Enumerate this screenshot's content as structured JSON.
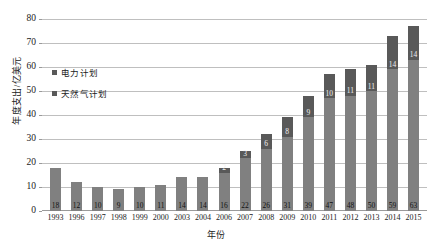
{
  "chart_data": {
    "type": "bar",
    "subtype": "stacked-bar",
    "title": "",
    "xlabel": "年份",
    "ylabel": "年度支出/亿美元",
    "ylim": [
      0,
      80
    ],
    "ytick_step": 10,
    "yticks": [
      "0",
      "10",
      "20",
      "30",
      "40",
      "50",
      "60",
      "70",
      "80"
    ],
    "grid": true,
    "legend_position": "inside-upper-left",
    "categories": [
      "1993",
      "1996",
      "1997",
      "1998",
      "1999",
      "2000",
      "2003",
      "2004",
      "2006",
      "2007",
      "2008",
      "2009",
      "2010",
      "2011",
      "2012",
      "2013",
      "2014",
      "2015"
    ],
    "series": [
      {
        "name": "天然气计划",
        "color": "#808080",
        "values": [
          18,
          12,
          10,
          9,
          10,
          11,
          14,
          14,
          16,
          22,
          26,
          31,
          39,
          47,
          48,
          50,
          59,
          63
        ],
        "labels": [
          "18",
          "12",
          "10",
          "9",
          "10",
          "11",
          "14",
          "14",
          "16",
          "22",
          "26",
          "31",
          "39",
          "47",
          "48",
          "50",
          "59",
          "63"
        ]
      },
      {
        "name": "电力计划",
        "color": "#595959",
        "values": [
          0,
          0,
          0,
          0,
          0,
          0,
          0,
          0,
          2,
          3,
          6,
          8,
          9,
          10,
          11,
          11,
          14,
          14
        ],
        "labels": [
          "",
          "",
          "",
          "",
          "",
          "",
          "",
          "",
          "2",
          "3",
          "6",
          "8",
          "9",
          "10",
          "11",
          "11",
          "14",
          "14"
        ]
      }
    ]
  },
  "legend": {
    "items": [
      {
        "label": "电力计划",
        "marker": "square-marker"
      },
      {
        "label": "天然气计划",
        "marker": "square-marker"
      }
    ]
  },
  "axes": {
    "y_title": "年度支出/亿美元",
    "x_title": "年份"
  }
}
